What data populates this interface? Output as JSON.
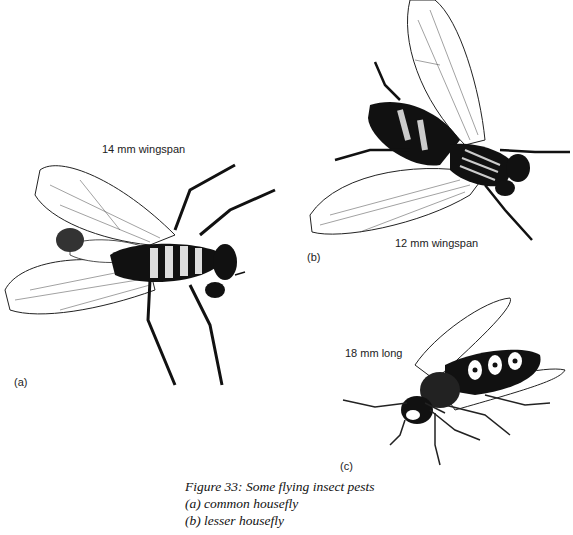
{
  "figure": {
    "panels": [
      {
        "id": "a",
        "tag": "(a)",
        "measure": "14 mm wingspan",
        "subject": "common housefly"
      },
      {
        "id": "b",
        "tag": "(b)",
        "measure": "12 mm wingspan",
        "subject": "lesser housefly"
      },
      {
        "id": "c",
        "tag": "(c)",
        "measure": "18 mm long",
        "subject": "wasp"
      }
    ],
    "caption": {
      "title": "Figure 33: Some flying insect pests",
      "lines": [
        "(a) common housefly",
        "(b) lesser housefly"
      ]
    }
  }
}
